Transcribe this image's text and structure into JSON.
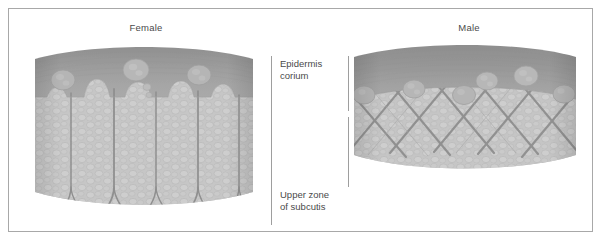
{
  "figure": {
    "type": "diagram",
    "border_color": "#a8a8a8",
    "background": "#ffffff",
    "text_color": "#4a4a4a"
  },
  "panels": [
    {
      "id": "female",
      "title": "Female",
      "side": "left",
      "structure": "vertical rectangular fat lobules separated by straight vertical septa; lobules protrude upward into the corium",
      "tissue_color": "#c3c3c3",
      "epidermis_color": "#9a9a9a",
      "septa_color": "#8f8f8f"
    },
    {
      "id": "male",
      "title": "Male",
      "side": "right",
      "structure": "criss-cross (X-shaped) lattice of septa forming small polygonal fat units; thicker, smooth corium band",
      "tissue_color": "#c3c3c3",
      "epidermis_color": "#9a9a9a",
      "septa_color": "#8f8f8f"
    }
  ],
  "annotations": [
    {
      "id": "epidermis-corium",
      "lines": [
        "Epidermis",
        "corium"
      ],
      "position": "upper-center",
      "bracket": "vertical-rule"
    },
    {
      "id": "upper-zone-subcutis",
      "lines": [
        "Upper zone",
        "of subcutis"
      ],
      "position": "lower-center",
      "bracket": "vertical-rule"
    }
  ],
  "rules": {
    "left_rule": "continuous vertical line spanning both zones",
    "right_rule_upper": "vertical line segment beside the corium zone",
    "right_rule_lower": "vertical line segment beside the subcutis zone"
  }
}
